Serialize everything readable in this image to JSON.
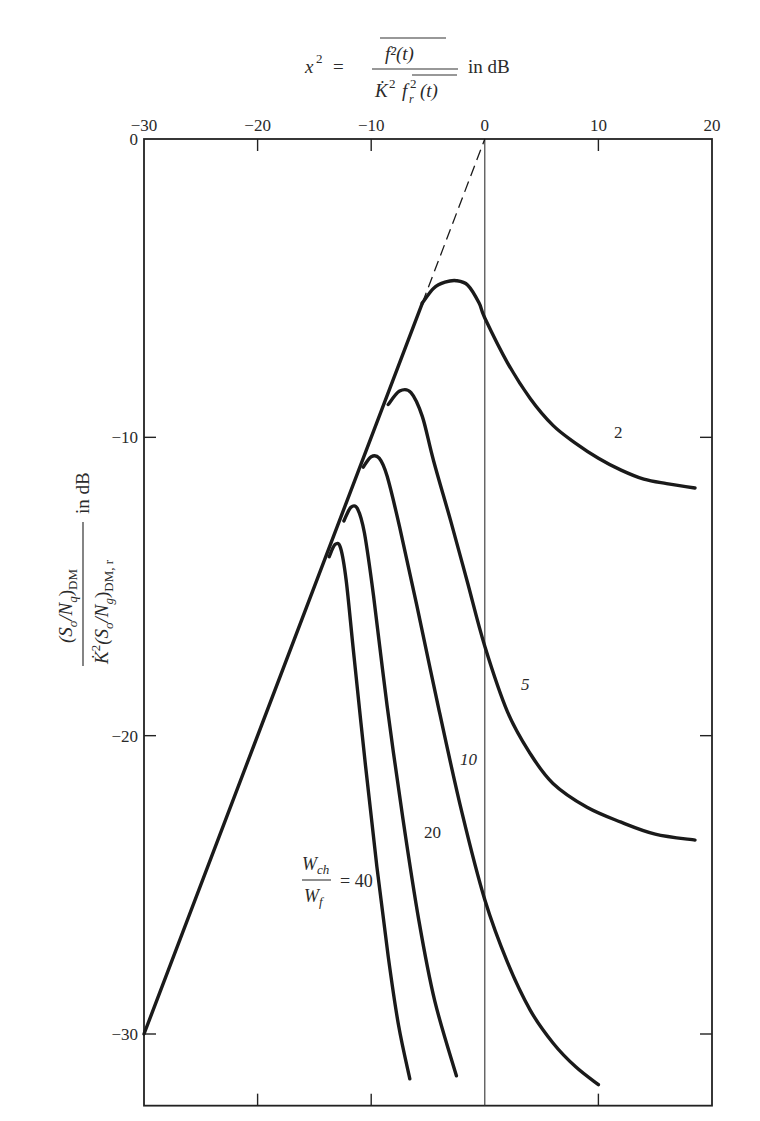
{
  "chart_data": {
    "type": "line",
    "xlabel": "x² = f²(t) / K̇² f_r²(t) in dB",
    "ylabel": "(S_o/N_q)_DM / K̇²(S_o/N_g)_DM,r in dB",
    "xlim": [
      -30,
      20
    ],
    "ylim": [
      -32,
      0
    ],
    "x_ticks": [
      -30,
      -20,
      -10,
      0,
      10,
      20
    ],
    "y_ticks": [
      0,
      -10,
      -20,
      -30
    ],
    "grid": false,
    "vertical_reference_line_x": 0,
    "legend": "Curves labelled by W_ch / W_f",
    "parameter_label": "W_ch / W_f",
    "asymptote": {
      "name": "slope-1 asymptote (dashed beyond departure)",
      "x": [
        -30,
        -5.5,
        0
      ],
      "y": [
        -30,
        -5.5,
        0
      ]
    },
    "series": [
      {
        "name": "W_ch/W_f = 2",
        "label": "2",
        "x": [
          -5.5,
          -4.5,
          -3.5,
          -2.5,
          -1.5,
          -0.5,
          0,
          2,
          4,
          6,
          8,
          10,
          12,
          14,
          16,
          18.5
        ],
        "y": [
          -5.5,
          -5.0,
          -4.8,
          -4.75,
          -4.9,
          -5.5,
          -6.0,
          -7.5,
          -8.7,
          -9.6,
          -10.2,
          -10.7,
          -11.1,
          -11.4,
          -11.55,
          -11.7
        ]
      },
      {
        "name": "W_ch/W_f = 5",
        "label": "5",
        "x": [
          -8.5,
          -7.5,
          -6.5,
          -5.5,
          -4.5,
          -3,
          -1.5,
          0,
          2,
          4,
          6,
          9,
          12,
          15,
          18.5
        ],
        "y": [
          -8.9,
          -8.45,
          -8.5,
          -9.3,
          -10.8,
          -12.8,
          -14.9,
          -17.0,
          -19.2,
          -20.6,
          -21.6,
          -22.4,
          -22.9,
          -23.3,
          -23.5
        ]
      },
      {
        "name": "W_ch/W_f = 10",
        "label": "10",
        "x": [
          -10.7,
          -10,
          -9.3,
          -8.6,
          -7.5,
          -6,
          -4,
          -2,
          0,
          2,
          4,
          6,
          8,
          10
        ],
        "y": [
          -11.0,
          -10.65,
          -10.7,
          -11.3,
          -13.0,
          -15.6,
          -19.2,
          -22.6,
          -25.5,
          -27.6,
          -29.2,
          -30.3,
          -31.1,
          -31.7
        ]
      },
      {
        "name": "W_ch/W_f = 20",
        "label": "20",
        "x": [
          -12.4,
          -11.8,
          -11.2,
          -10.6,
          -9.8,
          -8.6,
          -7.2,
          -5.8,
          -4.4,
          -2.5
        ],
        "y": [
          -12.8,
          -12.35,
          -12.4,
          -13.2,
          -15.3,
          -19.0,
          -22.8,
          -26.2,
          -28.9,
          -31.4
        ]
      },
      {
        "name": "W_ch/W_f = 40",
        "label": "40",
        "x": [
          -13.7,
          -13.2,
          -12.7,
          -12.2,
          -11.5,
          -10.5,
          -9.5,
          -8.5,
          -7.6,
          -6.6
        ],
        "y": [
          -14.0,
          -13.6,
          -13.7,
          -14.8,
          -17.4,
          -21.0,
          -24.4,
          -27.4,
          -29.7,
          -31.5
        ]
      }
    ]
  },
  "labels": {
    "x_axis_prefix": "x",
    "x_axis_exponent": "2",
    "x_axis_equals": "=",
    "x_axis_numerator": "f²(t)",
    "x_axis_denominator_k": "K̇",
    "x_axis_denominator_k_exp": "2",
    "x_axis_denominator_f": "f",
    "x_axis_denominator_f_sub": "r",
    "x_axis_denominator_f_exp": "2",
    "x_axis_denominator_t": "(t)",
    "x_axis_units": "in dB",
    "y_axis_numerator": "(Sₒ/N_q)_DM",
    "y_axis_numerator_main": "(S",
    "y_axis_numerator_o": "o",
    "y_axis_numerator_mid": "/N",
    "y_axis_numerator_q": "q",
    "y_axis_numerator_close": ")",
    "y_axis_numerator_dm": "DM",
    "y_axis_denominator_k": "K̇",
    "y_axis_denominator_k_exp": "2",
    "y_axis_denominator_main": "(S",
    "y_axis_denominator_o": "o",
    "y_axis_denominator_mid": "/N",
    "y_axis_denominator_g": "g",
    "y_axis_denominator_close": ")",
    "y_axis_denominator_sub": "DM, r",
    "y_axis_units": "in dB",
    "param_w_ch": "W",
    "param_ch_sub": "ch",
    "param_w_f": "W",
    "param_f_sub": "f",
    "param_equals_40": "= 40",
    "curve_2": "2",
    "curve_5": "5",
    "curve_10": "10",
    "curve_20": "20"
  }
}
